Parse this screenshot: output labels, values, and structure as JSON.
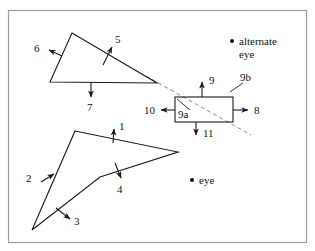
{
  "figure": {
    "background_color": "#ffffff",
    "frame_color": "#9a9a9a",
    "ink_color": "#1a1a1a",
    "dashed_color": "#8a8a8a",
    "frame": {
      "x": 8,
      "y": 10,
      "width": 299,
      "height": 233
    }
  },
  "labels": {
    "n1": "1",
    "n2": "2",
    "n3": "3",
    "n4": "4",
    "n5": "5",
    "n6": "6",
    "n7": "7",
    "n8": "8",
    "n9": "9",
    "n9a": "9a",
    "n9b": "9b",
    "n10": "10",
    "n11": "11",
    "eye": "eye",
    "alternate_eye_line1": "alternate",
    "alternate_eye_line2": "eye"
  },
  "shapes": {
    "upper_triangle": {
      "name": "upper-triangle",
      "points": "72,33 157,83 50,82",
      "edge_labels": [
        "5",
        "6",
        "7"
      ]
    },
    "lower_polygon": {
      "name": "lower-concave-polygon",
      "points": "75,131 178,152 100,177 32,230",
      "edge_labels": [
        "1",
        "4",
        "3",
        "2"
      ]
    },
    "rectangle": {
      "name": "occluder-rectangle",
      "x": 175,
      "y": 97,
      "width": 58,
      "height": 25,
      "edge_labels": [
        "9",
        "8",
        "11",
        "10"
      ]
    }
  },
  "points": {
    "eye": {
      "x": 192,
      "y": 180
    },
    "alternate_eye": {
      "x": 232,
      "y": 41
    }
  },
  "dashed_ray": {
    "name": "sight-line-from-alternate-eye",
    "from": {
      "x": 146,
      "y": 76
    },
    "to": {
      "x": 251,
      "y": 135
    }
  }
}
